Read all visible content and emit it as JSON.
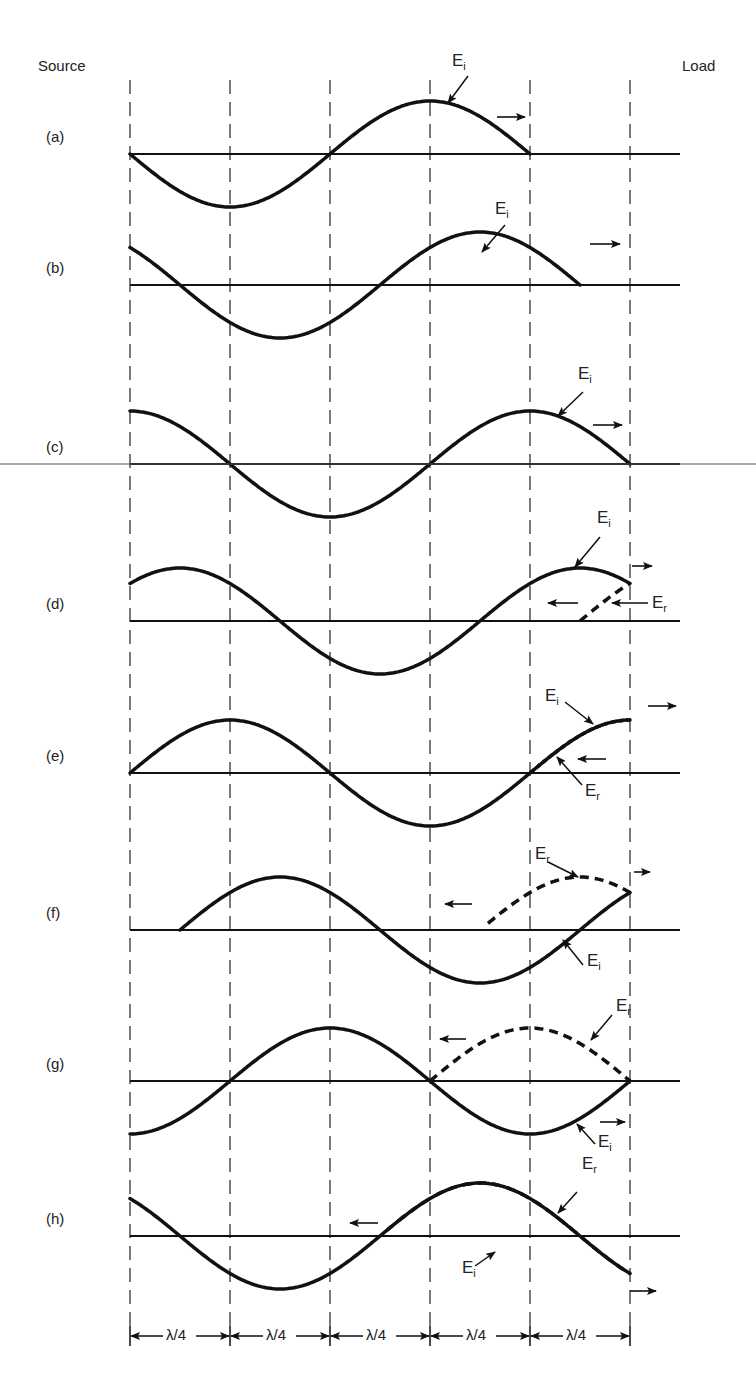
{
  "header": {
    "left_label": "Source",
    "right_label": "Load"
  },
  "geometry": {
    "x_lines": [
      130,
      230,
      330,
      430,
      530,
      630
    ],
    "baseline_x_start": 130,
    "baseline_x_end": 680,
    "wavelength_px": 400,
    "amplitude_px": 53,
    "dashed_line_top": 80,
    "dashed_line_bottom": 1330
  },
  "dimension_row": {
    "y": 1336,
    "segment_label": "λ/4",
    "segments": [
      "λ/4",
      "λ/4",
      "λ/4",
      "λ/4",
      "λ/4"
    ]
  },
  "colors": {
    "ink": "#111111",
    "dash": "#333333",
    "background": "#ffffff"
  },
  "panels": [
    {
      "id": "a",
      "label": "(a)",
      "baseline_y": 154,
      "incident": {
        "rise_zero_x": 330,
        "x_from": 130,
        "x_to": 530
      },
      "incident_label": {
        "text": "E",
        "sub": "i",
        "x": 452,
        "y": 55,
        "arrow_from": [
          468,
          76
        ],
        "arrow_to": [
          448,
          103
        ]
      },
      "motion_arrows": [
        {
          "dir": "right",
          "x1": 497,
          "x2": 525,
          "y": 117
        }
      ]
    },
    {
      "id": "b",
      "label": "(b)",
      "baseline_y": 285,
      "incident": {
        "rise_zero_x": 380,
        "x_from": 130,
        "x_to": 580
      },
      "incident_label": {
        "text": "E",
        "sub": "i",
        "x": 495,
        "y": 203,
        "arrow_from": [
          505,
          225
        ],
        "arrow_to": [
          482,
          252
        ]
      },
      "motion_arrows": [
        {
          "dir": "right",
          "x1": 590,
          "x2": 620,
          "y": 244
        }
      ]
    },
    {
      "id": "c",
      "label": "(c)",
      "baseline_y": 464,
      "incident": {
        "rise_zero_x": 430,
        "x_from": 130,
        "x_to": 630
      },
      "incident_label": {
        "text": "E",
        "sub": "i",
        "x": 578,
        "y": 368,
        "arrow_from": [
          583,
          392
        ],
        "arrow_to": [
          558,
          416
        ]
      },
      "motion_arrows": [
        {
          "dir": "right",
          "x1": 593,
          "x2": 622,
          "y": 425
        }
      ]
    },
    {
      "id": "d",
      "label": "(d)",
      "baseline_y": 621,
      "incident": {
        "rise_zero_x": 480,
        "x_from": 130,
        "x_to": 630
      },
      "reflected": {
        "rise_zero_x": 580,
        "x_from": 580,
        "x_to": 630,
        "mirror_at": 630
      },
      "incident_label": {
        "text": "E",
        "sub": "i",
        "x": 597,
        "y": 512,
        "arrow_from": [
          600,
          537
        ],
        "arrow_to": [
          575,
          567
        ]
      },
      "reflected_label": {
        "text": "E",
        "sub": "r",
        "x": 652,
        "y": 597,
        "arrow_from": [
          648,
          603
        ],
        "arrow_to": [
          612,
          603
        ]
      },
      "motion_arrows": [
        {
          "dir": "right",
          "x1": 632,
          "x2": 652,
          "y": 566
        },
        {
          "dir": "left",
          "x1": 548,
          "x2": 578,
          "y": 603
        }
      ]
    },
    {
      "id": "e",
      "label": "(e)",
      "baseline_y": 773,
      "incident": {
        "rise_zero_x": 530,
        "x_from": 130,
        "x_to": 630
      },
      "reflected": {
        "rise_zero_x": 530,
        "x_from": 530,
        "x_to": 630,
        "overlay": true
      },
      "incident_label": {
        "text": "E",
        "sub": "i",
        "x": 545,
        "y": 690,
        "arrow_from": [
          565,
          702
        ],
        "arrow_to": [
          593,
          724
        ]
      },
      "reflected_label": {
        "text": "E",
        "sub": "r",
        "x": 585,
        "y": 785,
        "arrow_from": [
          582,
          785
        ],
        "arrow_to": [
          557,
          757
        ]
      },
      "motion_arrows": [
        {
          "dir": "right",
          "x1": 648,
          "x2": 676,
          "y": 706
        },
        {
          "dir": "left",
          "x1": 578,
          "x2": 606,
          "y": 759
        }
      ]
    },
    {
      "id": "f",
      "label": "(f)",
      "baseline_y": 930,
      "incident": {
        "rise_zero_x": 580,
        "x_from": 180,
        "x_to": 630
      },
      "reflected": {
        "fall_zero_x": 680,
        "x_from": 488,
        "x_to": 630,
        "peak_x": 580
      },
      "incident_label": {
        "text": "E",
        "sub": "i",
        "x": 587,
        "y": 955,
        "arrow_from": [
          583,
          965
        ],
        "arrow_to": [
          563,
          940
        ]
      },
      "reflected_label": {
        "text": "E",
        "sub": "r",
        "x": 535,
        "y": 848,
        "arrow_from": [
          548,
          862
        ],
        "arrow_to": [
          578,
          877
        ]
      },
      "motion_arrows": [
        {
          "dir": "right",
          "x1": 634,
          "x2": 650,
          "y": 872
        },
        {
          "dir": "left",
          "x1": 445,
          "x2": 472,
          "y": 904
        }
      ]
    },
    {
      "id": "g",
      "label": "(g)",
      "baseline_y": 1081,
      "incident": {
        "rise_zero_x": 230,
        "x_from": 130,
        "x_to": 630
      },
      "reflected": {
        "rise_zero_x": 430,
        "x_from": 430,
        "x_to": 630
      },
      "incident_label": {
        "text": "E",
        "sub": "i",
        "x": 598,
        "y": 1136,
        "arrow_from": [
          595,
          1144
        ],
        "arrow_to": [
          577,
          1124
        ]
      },
      "reflected_label": {
        "text": "E",
        "sub": "r",
        "x": 616,
        "y": 1000,
        "arrow_from": [
          612,
          1015
        ],
        "arrow_to": [
          591,
          1040
        ]
      },
      "motion_arrows": [
        {
          "dir": "right",
          "x1": 600,
          "x2": 625,
          "y": 1122
        },
        {
          "dir": "left",
          "x1": 440,
          "x2": 466,
          "y": 1039
        }
      ]
    },
    {
      "id": "h",
      "label": "(h)",
      "baseline_y": 1236,
      "incident": {
        "rise_zero_x": -20,
        "x_from": 130,
        "x_to": 630,
        "fall_zero_x": 480
      },
      "reflected": {
        "rise_zero_x": 380,
        "x_from": 386,
        "x_to": 630
      },
      "incident_label": {
        "text": "E",
        "sub": "i",
        "x": 462,
        "y": 1262,
        "arrow_from": [
          475,
          1266
        ],
        "arrow_to": [
          495,
          1252
        ]
      },
      "reflected_label": {
        "text": "E",
        "sub": "r",
        "x": 582,
        "y": 1158,
        "arrow_from": [
          577,
          1192
        ],
        "arrow_to": [
          558,
          1213
        ]
      },
      "motion_arrows": [
        {
          "dir": "right",
          "x1": 630,
          "x2": 656,
          "y": 1291
        },
        {
          "dir": "left",
          "x1": 350,
          "x2": 378,
          "y": 1223
        }
      ]
    }
  ]
}
